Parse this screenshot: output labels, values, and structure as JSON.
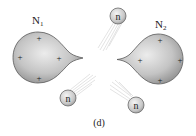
{
  "figure": {
    "caption": "(d)",
    "nuclei": [
      {
        "label_main": "N",
        "label_sub": "1",
        "charges": [
          "+",
          "+",
          "+",
          "+"
        ]
      },
      {
        "label_main": "N",
        "label_sub": "2",
        "charges": [
          "+",
          "+",
          "+",
          "+"
        ]
      }
    ],
    "neutrons": [
      {
        "label": "n"
      },
      {
        "label": "n"
      },
      {
        "label": "n"
      }
    ],
    "colors": {
      "nucleus_fill_light": "#e6e6e6",
      "nucleus_fill_dark": "#9a9a9a",
      "outline": "#5a5a5a",
      "trail": "#d8d8d8"
    }
  }
}
